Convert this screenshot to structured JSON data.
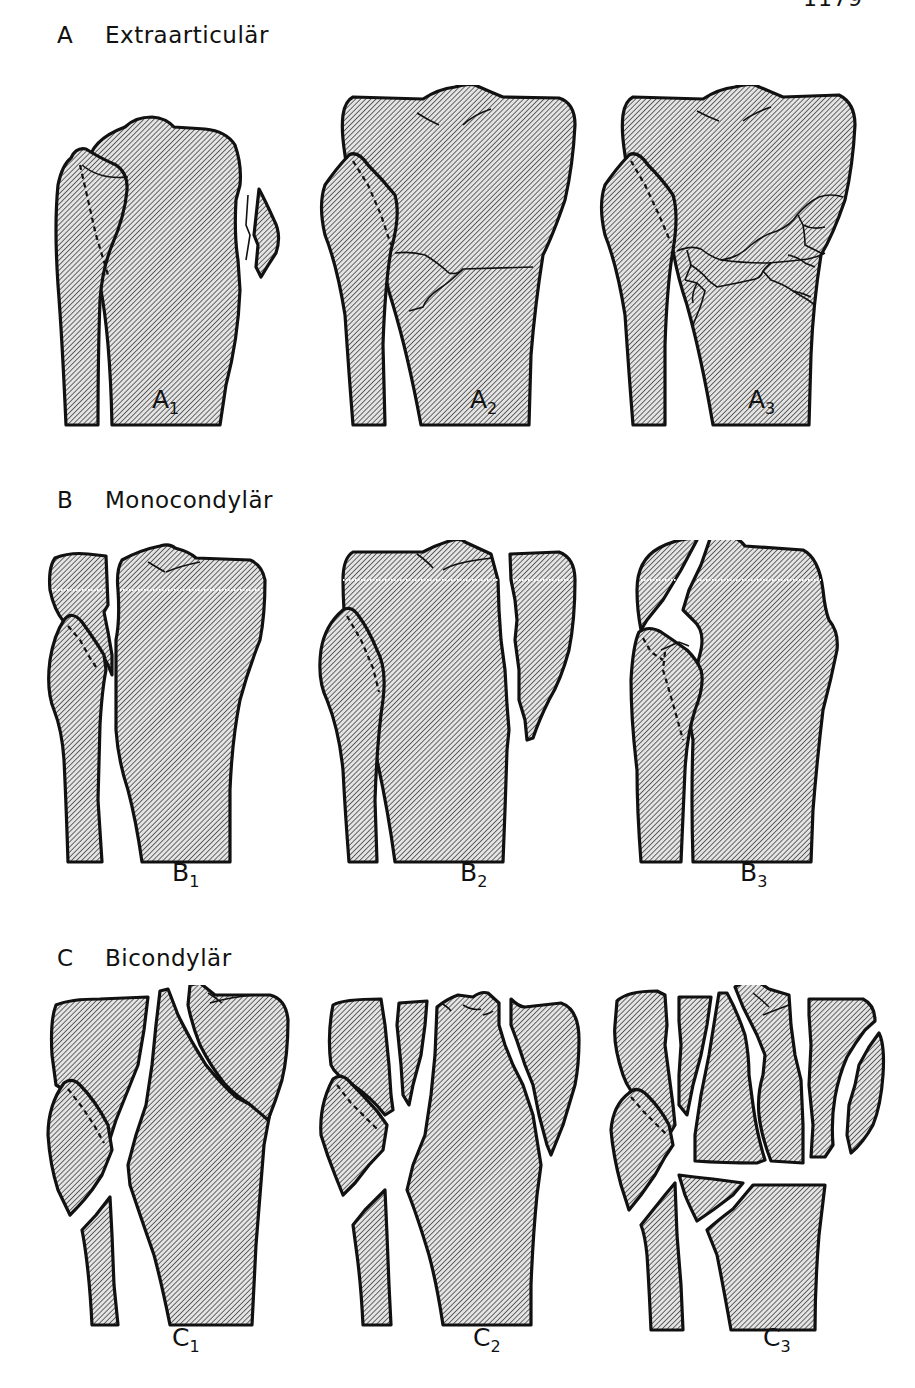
{
  "page": {
    "number": "1179"
  },
  "sections": [
    {
      "letter": "A",
      "title": "Extraarticulär",
      "figures": [
        {
          "label": "A",
          "sub": "1"
        },
        {
          "label": "A",
          "sub": "2"
        },
        {
          "label": "A",
          "sub": "3"
        }
      ]
    },
    {
      "letter": "B",
      "title": "Monocondylär",
      "figures": [
        {
          "label": "B",
          "sub": "1"
        },
        {
          "label": "B",
          "sub": "2"
        },
        {
          "label": "B",
          "sub": "3"
        }
      ]
    },
    {
      "letter": "C",
      "title": "Bicondylär",
      "figures": [
        {
          "label": "C",
          "sub": "1"
        },
        {
          "label": "C",
          "sub": "2"
        },
        {
          "label": "C",
          "sub": "3"
        }
      ]
    }
  ],
  "colors": {
    "ink": "#111111",
    "paper": "#ffffff",
    "hatch": "#8a8a8a"
  }
}
